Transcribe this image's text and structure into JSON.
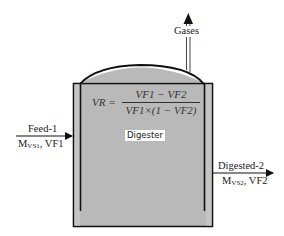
{
  "diagram": {
    "type": "process-schematic",
    "vessel": {
      "label": "Digester",
      "fill_color": "#b9b9b9",
      "stroke_color": "#111111"
    },
    "equation": {
      "lhs": "VR =",
      "numerator": "VF1 − VF2",
      "denominator": "VF1×(1 − VF2)"
    },
    "inlet": {
      "name": "Feed-1",
      "mass_symbol": "M",
      "mass_subscript": "VS1",
      "fraction_label": ", VF1"
    },
    "outlet": {
      "name": "Digested-2",
      "mass_symbol": "M",
      "mass_subscript": "VS2",
      "fraction_label": ", VF2"
    },
    "gas_outlet": {
      "name": "Gases"
    }
  }
}
